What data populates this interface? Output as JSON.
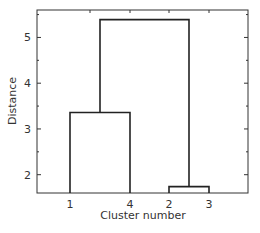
{
  "chart_data": {
    "type": "dendrogram",
    "title": "",
    "xlabel": "Cluster number",
    "ylabel": "Distance",
    "ylim": [
      1.6,
      5.6
    ],
    "yticks": [
      2,
      3,
      4,
      5
    ],
    "ytick_labels": [
      "2",
      "3",
      "4",
      "5"
    ],
    "leaf_order": [
      "1",
      "4",
      "2",
      "3"
    ],
    "merges": [
      {
        "left": "2",
        "right": "3",
        "height": 1.74
      },
      {
        "left": "1",
        "right": "4",
        "height": 3.36
      },
      {
        "left": "(1,4)",
        "right": "(2,3)",
        "height": 5.39
      }
    ],
    "grid": false,
    "legend": null,
    "line_color": "#222222"
  }
}
